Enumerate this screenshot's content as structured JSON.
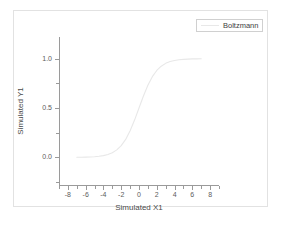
{
  "figure": {
    "background_color": "#ffffff",
    "border_color": "#e2e2e2"
  },
  "legend": {
    "entries": [
      {
        "label": "Boltzmann",
        "color": "#e8e8e8"
      }
    ],
    "position": "top-right",
    "border_color": "#d0d0d0"
  },
  "axes": {
    "x": {
      "title": "Simulated X1",
      "tick_labels": [
        "-8",
        "-6",
        "-4",
        "-2",
        "0",
        "2",
        "4",
        "6",
        "8"
      ],
      "tick_values": [
        -8,
        -6,
        -4,
        -2,
        0,
        2,
        4,
        6,
        8
      ],
      "range": [
        -9,
        9
      ],
      "minor_ticks": true,
      "color": "#9a9a9a"
    },
    "y": {
      "title": "Simulated Y1",
      "tick_labels": [
        "0.0",
        "0.5",
        "1.0"
      ],
      "tick_values": [
        0.0,
        0.5,
        1.0
      ],
      "range": [
        -0.28,
        1.22
      ],
      "minor_ticks": true,
      "color": "#9a9a9a"
    }
  },
  "chart_data": {
    "type": "line",
    "title": "",
    "xlabel": "Simulated X1",
    "ylabel": "Simulated Y1",
    "xlim": [
      -9,
      9
    ],
    "ylim": [
      -0.28,
      1.22
    ],
    "grid": false,
    "legend_position": "top-right",
    "series": [
      {
        "name": "Boltzmann",
        "color": "#e8e8e8",
        "line_width": 1,
        "model": "Boltzmann sigmoid: y = 1 / (1 + exp(-(x - x0)/dx))",
        "params": {
          "A1": 0.0,
          "A2": 1.0,
          "x0": 0.0,
          "dx": 1.0
        },
        "x": [
          -7.0,
          -6.5,
          -6.0,
          -5.5,
          -5.0,
          -4.5,
          -4.0,
          -3.5,
          -3.0,
          -2.5,
          -2.0,
          -1.5,
          -1.0,
          -0.5,
          0.0,
          0.5,
          1.0,
          1.5,
          2.0,
          2.5,
          3.0,
          3.5,
          4.0,
          4.5,
          5.0,
          5.5,
          6.0,
          6.5,
          7.0
        ],
        "y": [
          0.001,
          0.0015,
          0.0025,
          0.0041,
          0.0067,
          0.011,
          0.018,
          0.029,
          0.047,
          0.076,
          0.119,
          0.182,
          0.269,
          0.378,
          0.5,
          0.622,
          0.731,
          0.818,
          0.881,
          0.924,
          0.953,
          0.971,
          0.982,
          0.989,
          0.993,
          0.996,
          0.998,
          0.9985,
          0.999
        ]
      }
    ]
  }
}
